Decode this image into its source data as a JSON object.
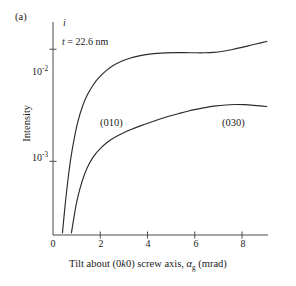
{
  "panel": {
    "label": "(a)"
  },
  "annotations": {
    "axis_symbol": "i",
    "thickness_italic": "t",
    "thickness_rest": " = 22.6 nm"
  },
  "chart_data": {
    "type": "line",
    "title": "",
    "panel_label": "(a)",
    "xlabel_full": "Tilt about (0k0) screw axis, αg (mrad)",
    "xlabel_parts": {
      "prefix": "Tilt about (0",
      "italic_k": "k",
      "middle": "0) screw axis, ",
      "alpha": "α",
      "alpha_sub": "g",
      "suffix": " (mrad)"
    },
    "ylabel": "Intensity",
    "yscale": "log",
    "xlim": [
      0,
      9.1
    ],
    "ylim": [
      0.00022,
      0.0175
    ],
    "grid": false,
    "legend": "inline-curve-labels",
    "xticks": [
      0,
      2,
      4,
      6,
      8
    ],
    "xtick_labels": [
      "0",
      "2",
      "4",
      "6",
      "8"
    ],
    "yticks": [
      0.01,
      0.001
    ],
    "ytick_labels": [
      "10⁻²",
      "10⁻³"
    ],
    "ytick_mantissa": "10",
    "ytick_exponents": [
      "-2",
      "-3"
    ],
    "annotation_thickness": "t = 22.6 nm",
    "annotation_axis_symbol": "i",
    "series": [
      {
        "name": "(010)",
        "label": "(010)",
        "label_x": 2.0,
        "label_y": 0.003,
        "color": "#2b2b2b",
        "x": [
          0.4,
          0.5,
          0.62,
          0.75,
          0.9,
          1.05,
          1.25,
          1.45,
          1.7,
          1.95,
          2.25,
          2.55,
          2.9,
          3.25,
          3.6,
          4.0,
          4.4,
          4.8,
          5.2,
          5.6,
          6.0,
          6.4,
          6.8,
          7.2,
          7.6,
          8.0,
          8.4,
          8.8,
          9.05
        ],
        "y": [
          0.00023,
          0.00038,
          0.00065,
          0.00105,
          0.0016,
          0.00225,
          0.0031,
          0.0039,
          0.0048,
          0.0056,
          0.00645,
          0.00715,
          0.0078,
          0.0083,
          0.00868,
          0.009,
          0.00918,
          0.00928,
          0.00932,
          0.00932,
          0.0093,
          0.0093,
          0.00938,
          0.0096,
          0.00995,
          0.0104,
          0.0109,
          0.0114,
          0.01175
        ]
      },
      {
        "name": "(030)",
        "label": "(030)",
        "label_x": 6.6,
        "label_y": 0.003,
        "color": "#2b2b2b",
        "x": [
          0.78,
          0.88,
          1.0,
          1.15,
          1.32,
          1.52,
          1.75,
          2.0,
          2.3,
          2.6,
          2.95,
          3.3,
          3.7,
          4.1,
          4.5,
          4.9,
          5.3,
          5.7,
          6.1,
          6.5,
          6.9,
          7.3,
          7.7,
          8.1,
          8.5,
          8.85,
          9.05
        ],
        "y": [
          0.00023,
          0.00031,
          0.00043,
          0.00058,
          0.00075,
          0.00094,
          0.00113,
          0.0013,
          0.00148,
          0.00163,
          0.00178,
          0.00192,
          0.00207,
          0.00222,
          0.00237,
          0.00252,
          0.00266,
          0.0028,
          0.00292,
          0.00303,
          0.00312,
          0.00318,
          0.00321,
          0.0032,
          0.00316,
          0.00311,
          0.00308
        ]
      }
    ]
  },
  "axes": {
    "x_axis_pixel_start": 53,
    "x_axis_pixel_end": 268,
    "y_axis_pixel_top": 22,
    "y_axis_pixel_bottom": 235
  }
}
